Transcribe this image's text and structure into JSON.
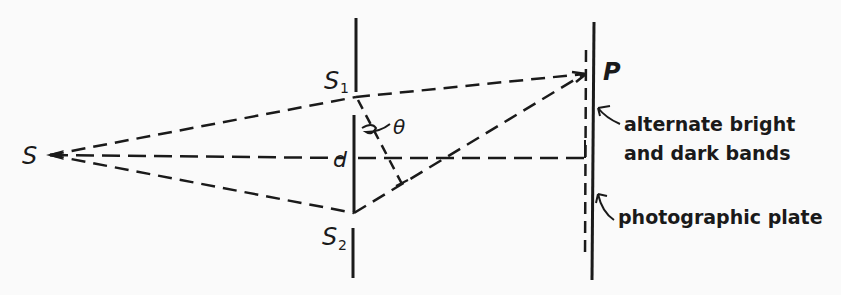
{
  "diagram": {
    "type": "double-slit interference (Young's experiment)",
    "labels": {
      "source": "S",
      "slit1": "S",
      "slit1_sub": "1",
      "slit2": "S",
      "slit2_sub": "2",
      "point": "P",
      "angle": "θ",
      "separation": "d"
    },
    "annotations": {
      "bands_line1": "alternate bright",
      "bands_line2": "and dark bands",
      "plate": "photographic plate"
    },
    "colors": {
      "ink": "#1a1a1a",
      "paper": "#fafafa"
    }
  }
}
